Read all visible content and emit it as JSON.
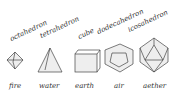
{
  "solids": [
    {
      "name": "octahedron",
      "element": "fire"
    },
    {
      "name": "tetrahedron",
      "element": "water"
    },
    {
      "name": "cube",
      "element": "earth"
    },
    {
      "name": "dodecahedron",
      "element": "air"
    },
    {
      "name": "icosahedron",
      "element": "aether"
    }
  ]
}
